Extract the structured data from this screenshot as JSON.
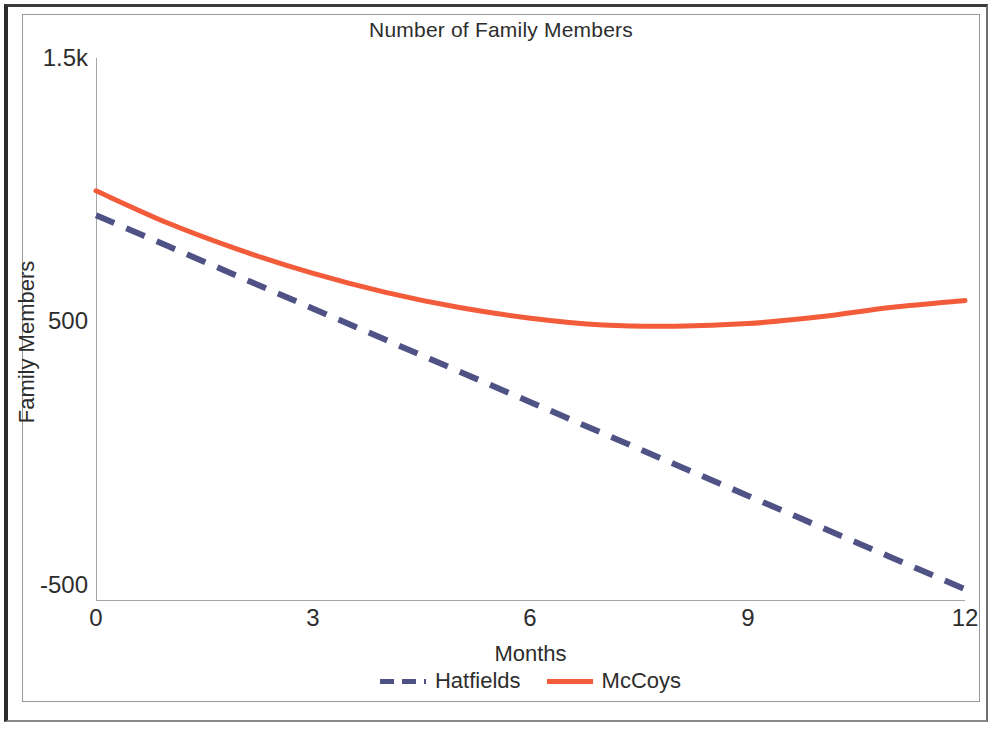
{
  "chart_data": {
    "type": "line",
    "title": "Number of Family Members",
    "xlabel": "Months",
    "ylabel": "Family Members",
    "xticks": [
      "0",
      "3",
      "6",
      "9",
      "12"
    ],
    "xtick_values": [
      0,
      3,
      6,
      9,
      12
    ],
    "yticks": [
      "1.5k",
      "500",
      "-500"
    ],
    "ytick_values": [
      1500,
      500,
      -500
    ],
    "xlim": [
      0,
      12
    ],
    "ylim": [
      -500,
      1500
    ],
    "grid": false,
    "legend_position": "bottom",
    "x": [
      0,
      1,
      2,
      3,
      4,
      5,
      6,
      7,
      8,
      9,
      10,
      11,
      12
    ],
    "series": [
      {
        "name": "Hatfields",
        "style": "dashed",
        "color": "#4f5285",
        "values": [
          920,
          805,
          690,
          575,
          460,
          345,
          230,
          115,
          0,
          -115,
          -230,
          -345,
          -460
        ]
      },
      {
        "name": "McCoys",
        "style": "solid",
        "color": "#f25c3b",
        "values": [
          1010,
          890,
          790,
          705,
          635,
          580,
          540,
          515,
          510,
          520,
          545,
          580,
          605
        ]
      }
    ]
  },
  "colors": {
    "hatfields": "#4f5285",
    "mccoys": "#f25c3b",
    "axis": "#a6a6a6",
    "text": "#2d2d2d",
    "frame_outer": "#2b2b2b",
    "frame_inner": "#9a9a9a"
  }
}
